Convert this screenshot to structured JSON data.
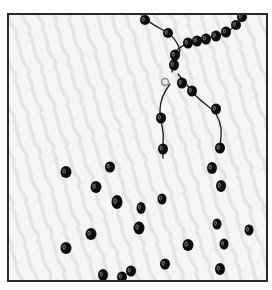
{
  "illustration": {
    "subject": "Broken bead necklace with scattered beads",
    "frame": {
      "x": 8,
      "y": 14,
      "width": 259,
      "height": 267,
      "stroke": "#2a2a2a",
      "stroke_width": 2
    },
    "background": {
      "base": "#f4f4f4",
      "stripe": "#e6e6e6"
    },
    "bead_color": "#0d0d0d",
    "bead_highlight": "#bdbdbd",
    "string_color": "#1a1a1a",
    "clasp_color": "#8a8a8a",
    "strands": [
      {
        "name": "top-left-strand",
        "d": "M142 16 C150 24 160 28 168 33 C175 38 178 44 180 50 C178 60 172 66 172 72"
      },
      {
        "name": "top-right-strand",
        "d": "M246 14 C240 24 232 30 222 34 C210 38 196 40 186 44 C178 48 172 54 172 62"
      },
      {
        "name": "left-hanging-strand",
        "d": "M170 84 C164 92 160 100 160 110 C160 118 162 124 163 132 C164 140 162 148 163 158"
      },
      {
        "name": "right-hanging-strand",
        "d": "M178 74 C184 82 190 88 196 96 C204 104 212 108 216 114 C222 124 222 132 220 146"
      }
    ],
    "clasp": {
      "cx": 165,
      "cy": 82,
      "r": 3.5
    },
    "strand_beads": [
      {
        "cx": 145,
        "cy": 20,
        "rx": 5,
        "ry": 5
      },
      {
        "cx": 168,
        "cy": 33,
        "rx": 5,
        "ry": 5
      },
      {
        "cx": 188,
        "cy": 43,
        "rx": 5,
        "ry": 5.5
      },
      {
        "cx": 197,
        "cy": 41,
        "rx": 5,
        "ry": 5.5
      },
      {
        "cx": 206,
        "cy": 39,
        "rx": 5,
        "ry": 5.5
      },
      {
        "cx": 216,
        "cy": 36,
        "rx": 5,
        "ry": 5.5
      },
      {
        "cx": 226,
        "cy": 32,
        "rx": 5,
        "ry": 5.5
      },
      {
        "cx": 236,
        "cy": 25,
        "rx": 5,
        "ry": 5
      },
      {
        "cx": 242,
        "cy": 17,
        "rx": 5,
        "ry": 5
      },
      {
        "cx": 175,
        "cy": 55,
        "rx": 5,
        "ry": 5.5
      },
      {
        "cx": 174,
        "cy": 65,
        "rx": 5,
        "ry": 5.5
      },
      {
        "cx": 182,
        "cy": 83,
        "rx": 5,
        "ry": 5.5
      },
      {
        "cx": 192,
        "cy": 91,
        "rx": 5,
        "ry": 5.5
      },
      {
        "cx": 216,
        "cy": 109,
        "rx": 5,
        "ry": 5.5
      },
      {
        "cx": 161,
        "cy": 118,
        "rx": 5,
        "ry": 5.5
      },
      {
        "cx": 163,
        "cy": 149,
        "rx": 5,
        "ry": 5.5
      },
      {
        "cx": 220,
        "cy": 148,
        "rx": 5,
        "ry": 5.5
      }
    ],
    "loose_beads": [
      {
        "cx": 66,
        "cy": 172,
        "rx": 5.5,
        "ry": 6
      },
      {
        "cx": 110,
        "cy": 167,
        "rx": 5,
        "ry": 5.5
      },
      {
        "cx": 96,
        "cy": 187,
        "rx": 5.5,
        "ry": 6
      },
      {
        "cx": 117,
        "cy": 202,
        "rx": 5.5,
        "ry": 7
      },
      {
        "cx": 141,
        "cy": 208,
        "rx": 4.5,
        "ry": 6
      },
      {
        "cx": 162,
        "cy": 199,
        "rx": 4.5,
        "ry": 5.5
      },
      {
        "cx": 212,
        "cy": 168,
        "rx": 5,
        "ry": 6
      },
      {
        "cx": 221,
        "cy": 186,
        "rx": 5,
        "ry": 6
      },
      {
        "cx": 139,
        "cy": 228,
        "rx": 5.5,
        "ry": 6.5
      },
      {
        "cx": 91,
        "cy": 234,
        "rx": 5.5,
        "ry": 6
      },
      {
        "cx": 66,
        "cy": 248,
        "rx": 5.5,
        "ry": 6
      },
      {
        "cx": 217,
        "cy": 224,
        "rx": 4.5,
        "ry": 5.5
      },
      {
        "cx": 249,
        "cy": 230,
        "rx": 4.5,
        "ry": 5.5
      },
      {
        "cx": 188,
        "cy": 245,
        "rx": 5.5,
        "ry": 6
      },
      {
        "cx": 224,
        "cy": 244,
        "rx": 4.5,
        "ry": 5.5
      },
      {
        "cx": 165,
        "cy": 264,
        "rx": 5,
        "ry": 5.5
      },
      {
        "cx": 220,
        "cy": 269,
        "rx": 5,
        "ry": 6
      },
      {
        "cx": 103,
        "cy": 275,
        "rx": 5,
        "ry": 6
      },
      {
        "cx": 122,
        "cy": 277,
        "rx": 5,
        "ry": 5.5
      },
      {
        "cx": 131,
        "cy": 271,
        "rx": 5,
        "ry": 5.5
      }
    ]
  }
}
